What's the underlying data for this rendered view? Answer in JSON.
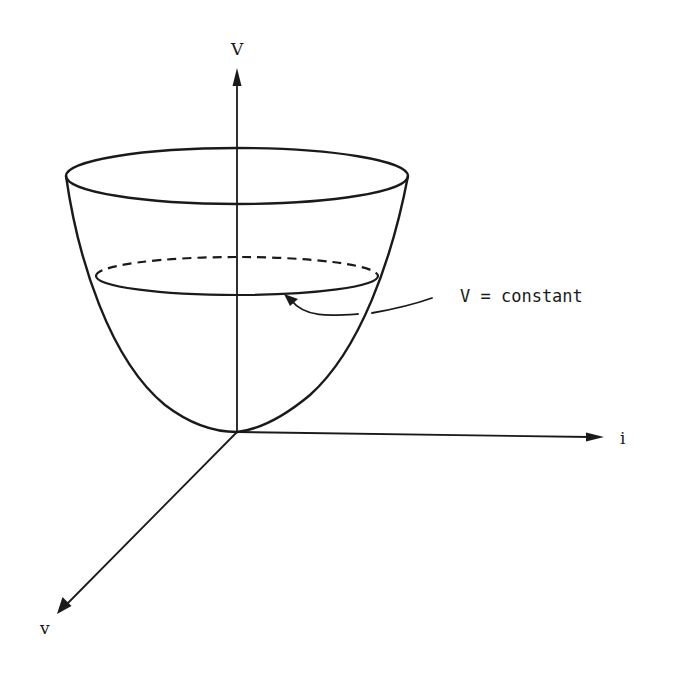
{
  "diagram": {
    "type": "3d-surface-sketch",
    "axes": {
      "vertical": {
        "label": "V",
        "origin": [
          237,
          432
        ],
        "end": [
          237,
          70
        ]
      },
      "horizontal": {
        "label": "i",
        "origin": [
          237,
          432
        ],
        "end": [
          603,
          437
        ]
      },
      "oblique": {
        "label": "v",
        "origin": [
          237,
          432
        ],
        "end": [
          58,
          613
        ]
      }
    },
    "annotation": {
      "text": "V = constant",
      "arrow_target": [
        285,
        295
      ]
    },
    "surface": {
      "rim_ellipse": {
        "cx": 237,
        "cy": 176,
        "rx": 171,
        "ry": 28
      },
      "level_ellipse": {
        "cx": 237,
        "cy": 276,
        "rx": 141,
        "ry": 19,
        "back_half_style": "dashed",
        "front_half_style": "solid"
      },
      "vertex": [
        237,
        432
      ]
    },
    "colors": {
      "ink": "#1a1a1a",
      "background": "#ffffff"
    }
  }
}
